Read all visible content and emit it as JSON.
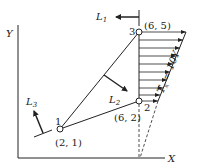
{
  "axes": {
    "x_label": "X",
    "y_label": "Y"
  },
  "nodes": [
    {
      "id": "1",
      "label": "1",
      "coord": "(2, 1)"
    },
    {
      "id": "2",
      "label": "2",
      "coord": "(6, 2)"
    },
    {
      "id": "3",
      "label": "3",
      "coord": "(6, 5)"
    }
  ],
  "edges": [
    {
      "name": "L1",
      "label": "L",
      "sub": "1",
      "from": "2",
      "to": "3"
    },
    {
      "name": "L2",
      "label": "L",
      "sub": "2",
      "from": "3",
      "to": "1"
    },
    {
      "name": "L3",
      "label": "L",
      "sub": "3",
      "from": "1",
      "to": "2"
    }
  ],
  "load": {
    "label_var": "T",
    "label_sub": "x",
    "label_rest": " = 10Y",
    "arrow_count": 10
  },
  "colors": {
    "line": "#222222",
    "background": "#ffffff"
  }
}
